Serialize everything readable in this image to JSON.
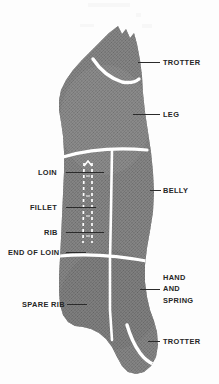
{
  "diagram": {
    "colors": {
      "meat_fill": "#7e7e7e",
      "meat_fill_dark": "#6f6f6f",
      "division_line": "#ffffff",
      "rib_dash": "#ffffff",
      "label_text": "#262626",
      "leader_line": "#2b2b2b",
      "background": "#fdfdfd"
    },
    "labels_left": [
      {
        "id": "loin",
        "text": "LOIN",
        "x": 38,
        "y": 168,
        "leader_x": 66,
        "leader_y": 172,
        "leader_w": 38
      },
      {
        "id": "fillet",
        "text": "FILLET",
        "x": 30,
        "y": 203,
        "leader_x": 66,
        "leader_y": 207,
        "leader_w": 30
      },
      {
        "id": "rib",
        "text": "RIB",
        "x": 44,
        "y": 228,
        "leader_x": 66,
        "leader_y": 232,
        "leader_w": 38
      },
      {
        "id": "end-of-loin",
        "text": "END OF LOIN",
        "x": 8,
        "y": 248,
        "leader_x": 66,
        "leader_y": 252,
        "leader_w": 20
      },
      {
        "id": "spare-rib",
        "text": "SPARE RIB",
        "x": 22,
        "y": 300,
        "leader_x": 67,
        "leader_y": 304,
        "leader_w": 20
      }
    ],
    "labels_right": [
      {
        "id": "trotter-top",
        "text": "TROTTER",
        "x": 163,
        "y": 58,
        "leader_x": 138,
        "leader_y": 62,
        "leader_w": 22
      },
      {
        "id": "leg",
        "text": "LEG",
        "x": 163,
        "y": 110,
        "leader_x": 133,
        "leader_y": 114,
        "leader_w": 27
      },
      {
        "id": "belly",
        "text": "BELLY",
        "x": 163,
        "y": 186,
        "leader_x": 150,
        "leader_y": 190,
        "leader_w": 11
      },
      {
        "id": "trotter-bottom",
        "text": "TROTTER",
        "x": 163,
        "y": 337,
        "leader_x": 148,
        "leader_y": 341,
        "leader_w": 12
      }
    ],
    "label_hand_and_spring": {
      "id": "hand-and-spring",
      "lines": [
        "HAND",
        "AND",
        "SPRING"
      ],
      "x": 163,
      "y": 272,
      "leader_x": 140,
      "leader_y": 289,
      "leader_w": 20
    }
  }
}
